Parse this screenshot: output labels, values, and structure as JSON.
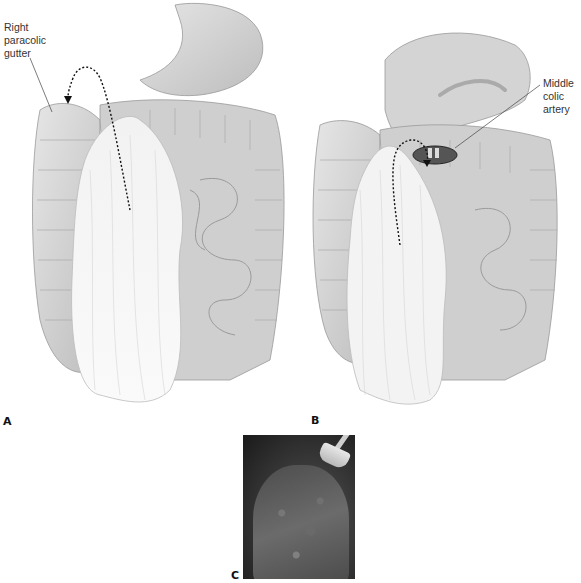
{
  "figure": {
    "panels": [
      {
        "id": "A",
        "label": "A",
        "callout": "Right\nparacolic\ngutter"
      },
      {
        "id": "B",
        "label": "B",
        "callout": "Middle\ncolic\nartery"
      },
      {
        "id": "C",
        "label": "C"
      }
    ],
    "colors": {
      "background": "#ffffff",
      "line": "#333333",
      "tissue": "#d9d9d9"
    }
  }
}
